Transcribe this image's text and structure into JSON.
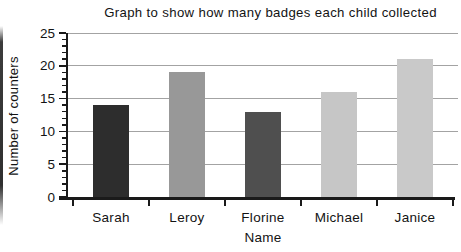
{
  "page": {
    "background": "#ffffff",
    "scan_artifact": "dark-left-edge-strip"
  },
  "chart_data": {
    "type": "bar",
    "title": "Graph to show how many badges each child collected",
    "xlabel": "Name",
    "ylabel": "Number of counters",
    "categories": [
      "Sarah",
      "Leroy",
      "Florine",
      "Michael",
      "Janice"
    ],
    "values": [
      14,
      19,
      13,
      16,
      21
    ],
    "ylim": [
      0,
      25
    ],
    "ytick_interval": 5,
    "ytick_labels": [
      "0",
      "5",
      "10",
      "15",
      "20",
      "25"
    ],
    "minor_tick_interval": 1,
    "grid": true,
    "legend": false,
    "bar_colors": [
      "#2d2d2d",
      "#989898",
      "#4f4f4f",
      "#c6c6c6",
      "#c9c9c9"
    ],
    "bar_textures": [
      "horizontal",
      "none",
      "vertical",
      "none",
      "vertical"
    ],
    "axis_color": "#1a1a1a",
    "gridline_color": "#a3a3a3",
    "layout": {
      "plot_left": 68,
      "plot_right": 458,
      "plot_top": 33,
      "plot_bottom": 197,
      "slot_start_x": 73,
      "slot_width": 76,
      "bar_width": 36
    }
  }
}
